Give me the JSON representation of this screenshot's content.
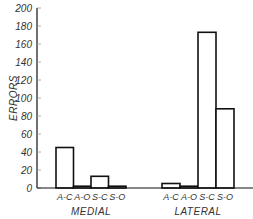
{
  "chart_data": {
    "type": "bar",
    "title": "",
    "xlabel": "",
    "ylabel": "ERRORS",
    "ylim": [
      0,
      200
    ],
    "yticks": [
      0,
      20,
      40,
      60,
      80,
      100,
      120,
      140,
      160,
      180,
      200
    ],
    "grid": false,
    "legend": null,
    "groups": [
      {
        "name": "MEDIAL",
        "categories": [
          "A-C",
          "A-O",
          "S-C",
          "S-O"
        ],
        "values": [
          45,
          2,
          13,
          2
        ]
      },
      {
        "name": "LATERAL",
        "categories": [
          "A-C",
          "A-O",
          "S-C",
          "S-O"
        ],
        "values": [
          5,
          2,
          173,
          88
        ]
      }
    ]
  },
  "colors": {
    "stroke": "#111111",
    "fill": "#ffffff",
    "text": "#333333"
  }
}
